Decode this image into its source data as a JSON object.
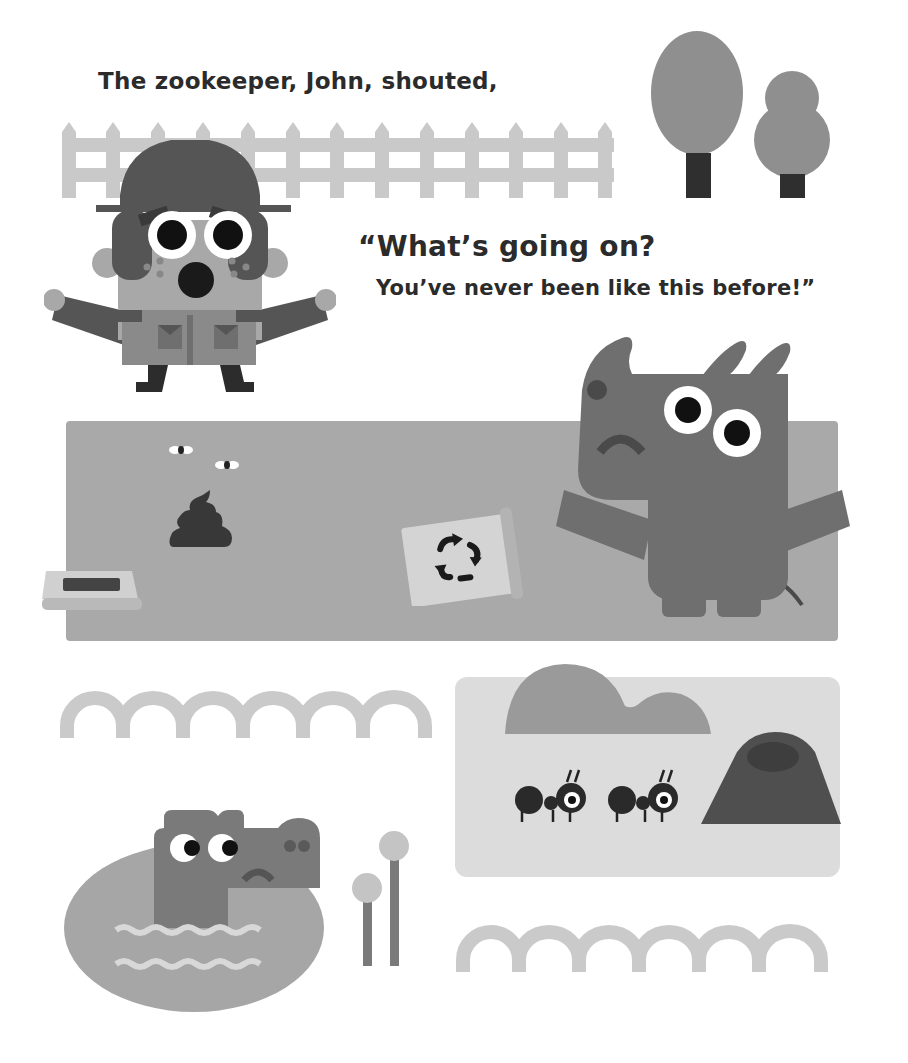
{
  "story": {
    "narration": "The zookeeper, John, shouted,",
    "dialog_line_1": "“What’s going on?",
    "dialog_line_2": "You’ve never been like this before!”"
  },
  "characters": {
    "zookeeper": {
      "name": "John",
      "expression": "surprised"
    },
    "rhino": {
      "expression": "sad"
    },
    "crocodile": {
      "expression": "sad"
    },
    "ants": {
      "count": 2
    }
  },
  "colors": {
    "background": "#ffffff",
    "text": "#2b2b2b",
    "fence": "#c9c9c9",
    "tree_canopy": "#8f8f8f",
    "tree_trunk": "#2f2f2f",
    "enclosure_ground": "#a9a9a9",
    "rhino_body": "#6f6f6f",
    "rhino_dark": "#4a4a4a",
    "ant_area": "#dcdcdc",
    "bush": "#9a9a9a",
    "anthill": "#4f4f4f",
    "pond": "#a6a6a6",
    "croc": "#7a7a7a",
    "arches": "#cacaca",
    "keeper_hat": "#555555",
    "keeper_skin": "#a8a8a8",
    "keeper_uniform": "#8a8a8a",
    "keeper_dark": "#3a3a3a",
    "eye_white": "#ffffff",
    "pupil": "#111111",
    "poop": "#383838",
    "cup": "#d4d4d4"
  },
  "icons": {
    "recycle": "recycle-icon",
    "poop": "poop-icon"
  }
}
